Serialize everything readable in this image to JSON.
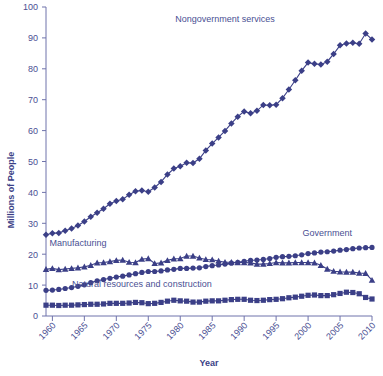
{
  "chart_data": {
    "type": "line",
    "title": "",
    "xlabel": "Year",
    "ylabel": "Millions of People",
    "xlim": [
      1959,
      2010
    ],
    "ylim": [
      0,
      100
    ],
    "ytick_step": 10,
    "xtick_step": 5,
    "grid": false,
    "legend": "inline-annotations",
    "yticks": [
      "0",
      "10",
      "20",
      "30",
      "40",
      "50",
      "60",
      "70",
      "80",
      "90",
      "100"
    ],
    "xticks": [
      "1960",
      "1965",
      "1970",
      "1975",
      "1980",
      "1985",
      "1990",
      "1995",
      "2000",
      "2005",
      "2010"
    ],
    "x": [
      1959,
      1960,
      1961,
      1962,
      1963,
      1964,
      1965,
      1966,
      1967,
      1968,
      1969,
      1970,
      1971,
      1972,
      1973,
      1974,
      1975,
      1976,
      1977,
      1978,
      1979,
      1980,
      1981,
      1982,
      1983,
      1984,
      1985,
      1986,
      1987,
      1988,
      1989,
      1990,
      1991,
      1992,
      1993,
      1994,
      1995,
      1996,
      1997,
      1998,
      1999,
      2000,
      2001,
      2002,
      2003,
      2004,
      2005,
      2006,
      2007,
      2008,
      2009,
      2010
    ],
    "series": [
      {
        "name": "Nongovernment services",
        "marker": "diamond",
        "color": "#3b3f87",
        "label_x": 1987,
        "label_y": 95,
        "values": [
          26.3,
          26.8,
          26.9,
          27.6,
          28.3,
          29.3,
          30.6,
          32.1,
          33.4,
          34.7,
          36.3,
          37.2,
          37.8,
          39.2,
          40.4,
          40.6,
          40.2,
          41.6,
          43.4,
          45.8,
          47.7,
          48.5,
          49.6,
          49.5,
          50.9,
          53.6,
          55.8,
          57.8,
          59.9,
          62.3,
          64.5,
          66.2,
          65.6,
          66.4,
          68.3,
          68.2,
          68.4,
          70.5,
          73.3,
          76.3,
          79.4,
          82.0,
          81.6,
          81.4,
          82.3,
          84.8,
          87.6,
          88.2,
          88.4,
          88.1,
          91.4,
          89.5
        ]
      },
      {
        "name": "Manufacturing",
        "marker": "triangle",
        "color": "#3b3f87",
        "label_x": 1964,
        "label_y": 22.5,
        "values": [
          15.1,
          15.4,
          15.0,
          15.2,
          15.4,
          15.6,
          15.9,
          16.4,
          17.2,
          17.3,
          17.6,
          18.0,
          18.1,
          17.4,
          17.3,
          18.4,
          18.6,
          17.0,
          17.2,
          18.0,
          18.5,
          18.6,
          19.4,
          19.4,
          18.8,
          18.3,
          18.2,
          17.8,
          17.4,
          17.4,
          17.3,
          17.3,
          17.2,
          16.8,
          16.8,
          17.0,
          17.3,
          17.2,
          17.2,
          17.3,
          17.3,
          17.3,
          17.2,
          16.4,
          15.2,
          14.5,
          14.3,
          14.2,
          14.2,
          13.9,
          13.8,
          11.6
        ]
      },
      {
        "name": "Government",
        "marker": "circle",
        "color": "#3b3f87",
        "label_x": 2003,
        "label_y": 26,
        "values": [
          8.3,
          8.4,
          8.6,
          8.9,
          9.2,
          9.6,
          10.1,
          10.8,
          11.4,
          11.8,
          12.2,
          12.6,
          12.9,
          13.3,
          13.7,
          14.1,
          14.4,
          14.4,
          14.6,
          14.9,
          15.1,
          15.4,
          15.4,
          15.5,
          15.6,
          16.0,
          16.3,
          16.5,
          16.8,
          17.1,
          17.4,
          17.7,
          18.0,
          18.1,
          18.3,
          18.6,
          19.0,
          19.2,
          19.3,
          19.5,
          19.8,
          20.2,
          20.4,
          20.7,
          20.8,
          21.0,
          21.3,
          21.5,
          21.8,
          22.0,
          22.1,
          22.2
        ]
      },
      {
        "name": "Natural resources and construction",
        "marker": "square",
        "color": "#3b3f87",
        "label_x": 1974,
        "label_y": 9.5,
        "values": [
          3.5,
          3.5,
          3.4,
          3.5,
          3.5,
          3.6,
          3.7,
          3.8,
          3.8,
          3.9,
          4.1,
          4.1,
          4.1,
          4.2,
          4.4,
          4.3,
          4.0,
          4.1,
          4.4,
          4.8,
          5.1,
          4.9,
          4.8,
          4.5,
          4.5,
          4.8,
          4.9,
          4.9,
          5.1,
          5.3,
          5.4,
          5.4,
          5.1,
          5.0,
          5.1,
          5.3,
          5.4,
          5.6,
          5.9,
          6.1,
          6.4,
          6.7,
          6.8,
          6.6,
          6.6,
          6.9,
          7.3,
          7.7,
          7.6,
          7.2,
          6.0,
          5.5
        ]
      }
    ]
  }
}
